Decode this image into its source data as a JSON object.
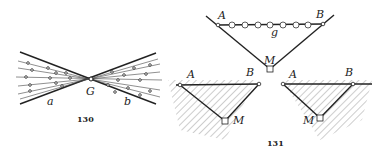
{
  "figures": [
    {
      "id": "fig130",
      "caption": "130",
      "labels": {
        "center": "G",
        "left_line": "a",
        "right_line": "b"
      }
    },
    {
      "id": "fig131",
      "caption": "131",
      "top_panel": {
        "left_point": "A",
        "right_point": "B",
        "segment": "g",
        "vertex": "M"
      },
      "bottom_left_panel": {
        "left_point": "A",
        "right_point": "B",
        "vertex": "M"
      },
      "bottom_right_panel": {
        "left_point": "A",
        "right_point": "B",
        "vertex": "M"
      }
    }
  ]
}
